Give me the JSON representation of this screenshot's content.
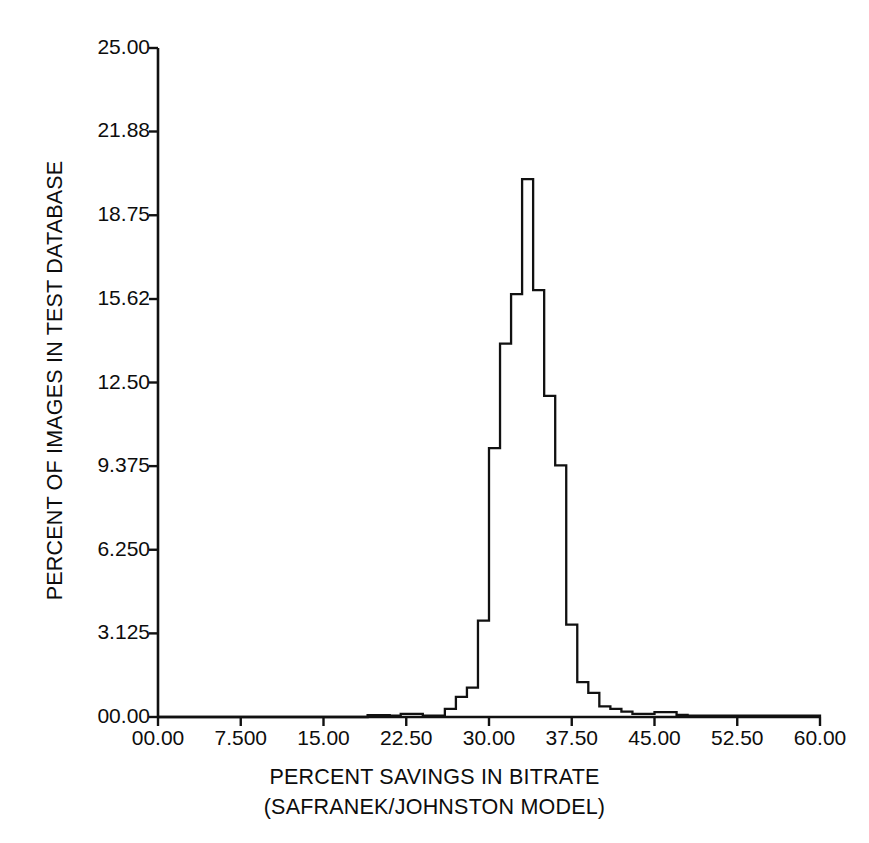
{
  "chart_data": {
    "type": "bar",
    "title": "",
    "subtitle": "",
    "xlabel": "PERCENT SAVINGS IN BITRATE",
    "xlabel_line2": "(SAFRANEK/JOHNSTON MODEL)",
    "ylabel": "PERCENT OF IMAGES IN TEST DATABASE",
    "xlim": [
      0,
      60
    ],
    "ylim": [
      0,
      25
    ],
    "grid": false,
    "legend": null,
    "x_tick_labels": [
      "00.00",
      "7.500",
      "15.00",
      "22.50",
      "30.00",
      "37.50",
      "45.00",
      "52.50",
      "60.00"
    ],
    "x_tick_values": [
      0,
      7.5,
      15,
      22.5,
      30,
      37.5,
      45,
      52.5,
      60
    ],
    "y_tick_labels": [
      "00.00",
      "3.125",
      "6.250",
      "9.375",
      "12.50",
      "15.62",
      "18.75",
      "21.88",
      "25.00"
    ],
    "y_tick_values": [
      0,
      3.125,
      6.25,
      9.375,
      12.5,
      15.62,
      18.75,
      21.88,
      25
    ],
    "bin_width": 1.0,
    "categories": [
      0.5,
      1.5,
      2.5,
      3.5,
      4.5,
      5.5,
      6.5,
      7.5,
      8.5,
      9.5,
      10.5,
      11.5,
      12.5,
      13.5,
      14.5,
      15.5,
      16.5,
      17.5,
      18.5,
      19.5,
      20.5,
      21.5,
      22.5,
      23.5,
      24.5,
      25.5,
      26.5,
      27.5,
      28.5,
      29.5,
      30.5,
      31.5,
      32.5,
      33.5,
      34.5,
      35.5,
      36.5,
      37.5,
      38.5,
      39.5,
      40.5,
      41.5,
      42.5,
      43.5,
      44.5,
      45.5,
      46.5,
      47.5,
      48.5,
      49.5,
      50.5,
      51.5,
      52.5,
      53.5,
      54.5,
      55.5,
      56.5,
      57.5,
      58.5,
      59.5
    ],
    "values": [
      0,
      0,
      0,
      0,
      0,
      0,
      0,
      0,
      0,
      0,
      0,
      0,
      0,
      0,
      0,
      0,
      0,
      0,
      0,
      0.07,
      0.07,
      0.05,
      0.12,
      0.12,
      0.05,
      0.05,
      0.3,
      0.75,
      1.1,
      3.6,
      10.05,
      13.95,
      15.8,
      20.1,
      15.95,
      12.0,
      9.4,
      3.45,
      1.3,
      0.9,
      0.4,
      0.3,
      0.2,
      0.12,
      0.12,
      0.18,
      0.18,
      0.08,
      0.05,
      0.05,
      0.05,
      0.05,
      0.05,
      0.05,
      0.05,
      0.05,
      0.05,
      0.05,
      0.05,
      0.05
    ],
    "peak_value": 20.1,
    "peak_x": 33.5,
    "line_color": "#111111",
    "fill": "none",
    "series_style": "step-outline"
  }
}
